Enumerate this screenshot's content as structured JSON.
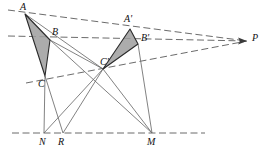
{
  "figure": {
    "type": "geometry-diagram",
    "canvas": {
      "width": 271,
      "height": 154
    },
    "colors": {
      "stroke": "#4a4a4a",
      "dashed_stroke": "#5a5a5a",
      "triangle_fill": "#9e9e9e",
      "triangle_stroke": "#2b2b2b",
      "label": "#111111",
      "background": "#ffffff"
    },
    "points": [
      {
        "id": "A",
        "label": "A",
        "x": 25,
        "y": 14,
        "label_x": 20,
        "label_y": 2
      },
      {
        "id": "B",
        "label": "B",
        "x": 50,
        "y": 40,
        "label_x": 52,
        "label_y": 27
      },
      {
        "id": "C",
        "label": "C",
        "x": 45,
        "y": 76,
        "label_x": 38,
        "label_y": 79
      },
      {
        "id": "Ap",
        "label": "A'",
        "x": 130,
        "y": 29,
        "label_x": 124,
        "label_y": 14
      },
      {
        "id": "Bp",
        "label": "B'",
        "x": 138,
        "y": 44,
        "label_x": 141,
        "label_y": 33
      },
      {
        "id": "Cp",
        "label": "C'",
        "x": 103,
        "y": 69,
        "label_x": 100,
        "label_y": 57
      },
      {
        "id": "N",
        "label": "N",
        "x": 44,
        "y": 133,
        "label_x": 39,
        "label_y": 137
      },
      {
        "id": "R",
        "label": "R",
        "x": 63,
        "y": 133,
        "label_x": 58,
        "label_y": 137
      },
      {
        "id": "M",
        "label": "M",
        "x": 152,
        "y": 133,
        "label_x": 147,
        "label_y": 137
      },
      {
        "id": "P",
        "label": "P",
        "x": 247,
        "y": 41,
        "label_x": 252,
        "label_y": 33
      }
    ],
    "triangles": [
      {
        "id": "ABC",
        "vertices": [
          "A",
          "B",
          "C"
        ],
        "filled": true
      },
      {
        "id": "ApBpCp",
        "vertices": [
          "Ap",
          "Bp",
          "Cp"
        ],
        "filled": true
      }
    ],
    "dashed_lines": [
      {
        "id": "line-A-Ap-P",
        "from": [
          8,
          10
        ],
        "to": [
          247,
          41
        ],
        "note": "through A and A' to P"
      },
      {
        "id": "line-B-Bp-P",
        "from": [
          8,
          36
        ],
        "to": [
          247,
          41
        ],
        "note": "through B and B' to P"
      },
      {
        "id": "line-C-Cp-P",
        "from": [
          26,
          83
        ],
        "to": [
          247,
          41
        ],
        "note": "through C and C' to P"
      },
      {
        "id": "axis-NRM",
        "from": [
          12,
          133
        ],
        "to": [
          205,
          133
        ],
        "note": "axis of perspectivity through N, R, M"
      }
    ],
    "solid_lines": [
      {
        "id": "seg-C-N",
        "from": "C",
        "to": "N"
      },
      {
        "id": "seg-C-R",
        "from": "C",
        "to": "R"
      },
      {
        "id": "seg-B-M",
        "from": "B",
        "to": "M"
      },
      {
        "id": "seg-Cp-N",
        "from": "Cp",
        "to": "N"
      },
      {
        "id": "seg-Cp-R",
        "from": "Cp",
        "to": "R"
      },
      {
        "id": "seg-Cp-M",
        "from": "Cp",
        "to": "M"
      },
      {
        "id": "seg-Bp-M",
        "from": "Bp",
        "to": "M"
      },
      {
        "id": "seg-B-Cp",
        "from": "B",
        "to": "Cp"
      },
      {
        "id": "seg-A-Cp",
        "from": "A",
        "to": "Cp"
      }
    ],
    "arrow": {
      "id": "arrow-to-P",
      "tip_x": 247,
      "tip_y": 41
    }
  }
}
